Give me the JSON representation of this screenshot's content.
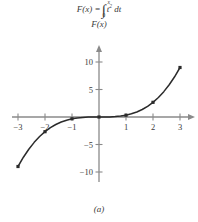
{
  "figure": {
    "formula": {
      "lhs": "F(x) =",
      "integral_sign": "∫",
      "upper_limit": "x",
      "lower_limit": "0",
      "integrand_base": "t",
      "integrand_exponent": "2",
      "differential": "dt",
      "full_text": "F(x) = ∫₀ˣ t² dt"
    },
    "y_axis_label": "F(x)",
    "caption": "(a)"
  },
  "chart_data": {
    "type": "line",
    "xlabel": "",
    "ylabel": "F(x)",
    "xlim": [
      -3.3,
      3.3
    ],
    "ylim": [
      -11.5,
      11.0
    ],
    "grid": false,
    "legend": null,
    "x_ticks": [
      -3,
      -2,
      -1,
      1,
      2,
      3
    ],
    "x_tick_labels": [
      "−3",
      "−2",
      "−1",
      "1",
      "2",
      "3"
    ],
    "y_ticks": [
      -10,
      -5,
      5,
      10
    ],
    "y_tick_labels": [
      "−10",
      "−5",
      "5",
      "10"
    ],
    "series": [
      {
        "name": "F(x) = x³/3",
        "marked_points": [
          {
            "x": -3,
            "y": -9
          },
          {
            "x": -2,
            "y": -2.67
          },
          {
            "x": -1,
            "y": -0.33
          },
          {
            "x": 0,
            "y": 0
          },
          {
            "x": 1,
            "y": 0.33
          },
          {
            "x": 2,
            "y": 2.67
          },
          {
            "x": 3,
            "y": 9
          }
        ],
        "x": [
          -3,
          -2.8,
          -2.6,
          -2.4,
          -2.2,
          -2,
          -1.8,
          -1.6,
          -1.4,
          -1.2,
          -1,
          -0.8,
          -0.6,
          -0.4,
          -0.2,
          0,
          0.2,
          0.4,
          0.6,
          0.8,
          1,
          1.2,
          1.4,
          1.6,
          1.8,
          2,
          2.2,
          2.4,
          2.6,
          2.8,
          3
        ],
        "y": [
          -9,
          -7.317,
          -5.859,
          -4.608,
          -3.549,
          -2.667,
          -1.944,
          -1.365,
          -0.915,
          -0.576,
          -0.333,
          -0.171,
          -0.072,
          -0.021,
          -0.003,
          0,
          0.003,
          0.021,
          0.072,
          0.171,
          0.333,
          0.576,
          0.915,
          1.365,
          1.944,
          2.667,
          3.549,
          4.608,
          5.859,
          7.317,
          9
        ]
      }
    ]
  },
  "colors": {
    "curve": "#2b2b2b",
    "axis": "#8a8a8a",
    "text": "#3a3a3a",
    "marker": "#2b2b2b"
  }
}
